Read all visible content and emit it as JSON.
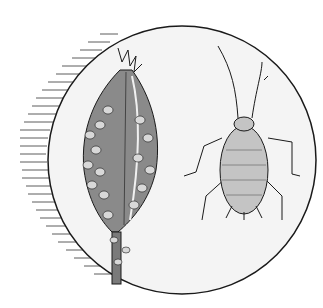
{
  "illustration": {
    "subject": "aphid infestation",
    "elements": [
      "plant-bud-with-aphid-colony",
      "single-aphid-enlarged"
    ],
    "colors": {
      "background": "#ffffff",
      "circle_fill": "#f4f4f4",
      "outline": "#1a1a1a",
      "bud_fill": "#8a8a8a",
      "aphid_fill": "#c4c4c4",
      "hatching": "#333333"
    }
  }
}
